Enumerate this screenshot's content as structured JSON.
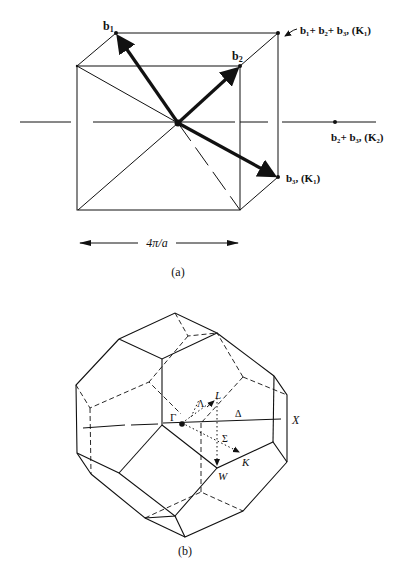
{
  "figure_a": {
    "caption": "(a)",
    "labels": {
      "b1": "b",
      "b1_sub": "1",
      "b2": "b",
      "b2_sub": "2",
      "sum_all": "b₁+ b₂+ b₃, (K₁)",
      "b2b3": "b₂+ b₃, (K₂)",
      "b3": "b₃, (K₁)",
      "width": "4π/a"
    },
    "colors": {
      "line": "#111111",
      "background": "#ffffff"
    }
  },
  "figure_b": {
    "caption": "(b)",
    "labels": {
      "gamma": "Γ",
      "lambda": "Λ",
      "L": "L",
      "delta": "Δ",
      "X": "X",
      "sigma": "Σ",
      "K": "K",
      "W": "W"
    }
  }
}
